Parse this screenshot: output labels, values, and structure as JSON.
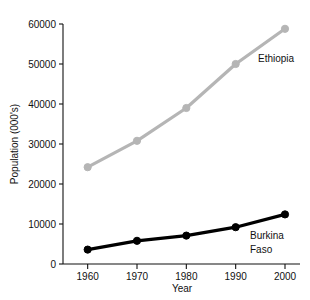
{
  "chart_data": {
    "type": "line",
    "title": "",
    "xlabel": "Year",
    "ylabel": "Population (000's)",
    "x": [
      1960,
      1970,
      1980,
      1990,
      2000
    ],
    "xtick_labels": [
      "1960",
      "1970",
      "1980",
      "1990",
      "2000"
    ],
    "ytick_labels": [
      "0",
      "10000",
      "20000",
      "30000",
      "40000",
      "50000",
      "60000"
    ],
    "yticks": [
      0,
      10000,
      20000,
      30000,
      40000,
      50000,
      60000
    ],
    "xlim": [
      1955,
      2000
    ],
    "ylim": [
      0,
      60000
    ],
    "grid": false,
    "legend_position": "inline-annotation",
    "series": [
      {
        "name": "Ethiopia",
        "color": "#b5b5b5",
        "marker": "circle",
        "values": [
          24200,
          30800,
          39000,
          50000,
          58800
        ],
        "label_text": "Ethiopia"
      },
      {
        "name": "Burkina Faso",
        "color": "#000000",
        "marker": "circle",
        "values": [
          3600,
          5800,
          7100,
          9200,
          12400
        ],
        "label_text": "Burkina Faso",
        "label_lines": [
          "Burkina",
          "Faso"
        ]
      }
    ]
  },
  "axis": {
    "y_title": "Population (000's)",
    "x_title": "Year"
  },
  "annotations": {
    "ethiopia": "Ethiopia",
    "burkina_line1": "Burkina",
    "burkina_line2": "Faso"
  },
  "colors": {
    "ethiopia": "#b5b5b5",
    "burkina_faso": "#000000",
    "axis": "#111111",
    "background": "#ffffff"
  }
}
